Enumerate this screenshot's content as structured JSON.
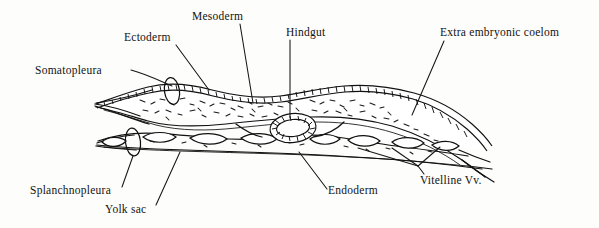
{
  "figure": {
    "background_color": "#fdfdfb",
    "ink_color": "#111111"
  },
  "labels": [
    {
      "id": "somatopleura",
      "text": "Somatopleura",
      "x": 35,
      "y": 74,
      "anchor": "start"
    },
    {
      "id": "ectoderm",
      "text": "Ectoderm",
      "x": 124,
      "y": 41,
      "anchor": "start"
    },
    {
      "id": "mesoderm",
      "text": "Mesoderm",
      "x": 192,
      "y": 20,
      "anchor": "start"
    },
    {
      "id": "hindgut",
      "text": "Hindgut",
      "x": 286,
      "y": 36,
      "anchor": "start"
    },
    {
      "id": "extra-coelom",
      "text": "Extra embryonic coelom",
      "x": 440,
      "y": 36,
      "anchor": "start"
    },
    {
      "id": "vitelline-vv",
      "text": "Vitelline Vv.",
      "x": 420,
      "y": 184,
      "anchor": "start"
    },
    {
      "id": "endoderm",
      "text": "Endoderm",
      "x": 328,
      "y": 194,
      "anchor": "start"
    },
    {
      "id": "yolk-sac",
      "text": "Yolk sac",
      "x": 105,
      "y": 213,
      "anchor": "start"
    },
    {
      "id": "splanchnopleura",
      "text": "Splanchnopleura",
      "x": 30,
      "y": 194,
      "anchor": "start"
    }
  ],
  "leaders": [
    {
      "id": "leader-somatopleura",
      "d": "M 131 70 C 146 74 158 80 172 86"
    },
    {
      "id": "leader-ectoderm",
      "d": "M 176 45 L 209 90"
    },
    {
      "id": "leader-mesoderm",
      "d": "M 240 24 L 253 103"
    },
    {
      "id": "leader-hindgut",
      "d": "M 290 40 L 290 118"
    },
    {
      "id": "leader-coelom",
      "d": "M 444 41 L 412 115"
    },
    {
      "id": "leader-endoderm",
      "d": "M 299 152 L 327 189"
    },
    {
      "id": "leader-splanchno",
      "d": "M 133 155 L 122 187"
    },
    {
      "id": "leader-yolksac",
      "d": "M 180 152 L 156 204"
    },
    {
      "id": "leader-vit-1",
      "d": "M 358 147 L 418 166"
    },
    {
      "id": "leader-vit-2",
      "d": "M 392 147 L 418 166"
    },
    {
      "id": "leader-vit-3",
      "d": "M 438 146 L 418 166"
    },
    {
      "id": "leader-vit-stem",
      "d": "M 418 166 L 424 175"
    }
  ],
  "structures": {
    "somatopleura_label_tip": "left tapering sheet upper layer",
    "splanchnopleura_label_tip": "lower sheet with vitelline vessels",
    "hindgut_ring": "oval epithelial ring, center (293,128)",
    "lasso_upper": {
      "cx": 172,
      "cy": 89,
      "rx": 7,
      "ry": 13
    },
    "lasso_lower": {
      "cx": 133,
      "cy": 141,
      "rx": 7,
      "ry": 14
    }
  }
}
